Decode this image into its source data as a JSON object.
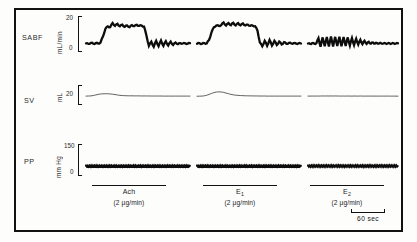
{
  "figure": {
    "rows": [
      {
        "key": "sabf",
        "label": "SABF",
        "unit": "mL/min",
        "tick_high": "20",
        "tick_low": "0"
      },
      {
        "key": "sv",
        "label": "SV",
        "unit": "mL",
        "tick_high": "20",
        "tick_low": ""
      },
      {
        "key": "pp",
        "label": "PP",
        "unit": "mm Hg",
        "tick_high": "150",
        "tick_low": "0"
      }
    ],
    "drugs": [
      {
        "name": "Ach",
        "sub": "",
        "dose": "(2 µg/min)"
      },
      {
        "name": "E",
        "sub": "1",
        "dose": "(2 µg/min)"
      },
      {
        "name": "E",
        "sub": "2",
        "dose": "(2 µg/min)"
      }
    ],
    "timescale": {
      "label": "60  sec"
    }
  },
  "chart_data": {
    "type": "line",
    "title": "",
    "xlabel": "",
    "ylabel": "",
    "grid": false,
    "legend": "none",
    "time_axis": {
      "unit": "sec",
      "scalebar_seconds": 60
    },
    "panels": [
      {
        "row": "SABF",
        "ylabel": "mL/min",
        "ylim": [
          0,
          20
        ],
        "yticks": [
          0,
          20
        ],
        "trials": [
          {
            "drug": "Ach",
            "dose": "2 µg/min",
            "description": "low oscillating baseline, sharp rise to sustained elevated plateau during infusion, then abrupt fall to baseline with large oscillations",
            "values": [
              4.5,
              4.2,
              4.8,
              4.3,
              4.6,
              4.4,
              5.0,
              8.5,
              13.0,
              14.5,
              14.0,
              16.5,
              14.8,
              16.0,
              14.5,
              15.5,
              14.2,
              15.0,
              14.0,
              15.2,
              14.6,
              15.4,
              14.8,
              15.0,
              14.4,
              9.0,
              3.0,
              5.5,
              2.5,
              6.0,
              2.8,
              6.2,
              3.0,
              5.8,
              3.2,
              5.5,
              3.5,
              5.0,
              4.0,
              4.6,
              4.4,
              4.5,
              4.3,
              4.6
            ]
          },
          {
            "drug": "E1",
            "dose": "2 µg/min",
            "description": "low baseline, rise to broad flat-topped plateau with fine ripples, fall to baseline with oscillations",
            "values": [
              4.3,
              4.6,
              4.2,
              4.7,
              4.4,
              6.5,
              11.0,
              14.0,
              15.0,
              14.8,
              15.2,
              16.8,
              15.0,
              16.5,
              15.2,
              16.6,
              15.0,
              16.4,
              15.1,
              16.2,
              15.0,
              15.5,
              14.8,
              15.0,
              14.6,
              12.0,
              5.0,
              2.8,
              6.0,
              3.0,
              6.5,
              3.2,
              6.0,
              3.5,
              5.6,
              3.8,
              5.2,
              4.2,
              4.8,
              4.4,
              4.6,
              4.3,
              4.5,
              4.4
            ]
          },
          {
            "drug": "E2",
            "dose": "2 µg/min",
            "description": "baseline with a burst of rapid large-amplitude oscillations during infusion, no sustained plateau",
            "values": [
              4.4,
              4.2,
              4.6,
              4.3,
              4.5,
              7.5,
              2.5,
              8.0,
              2.8,
              8.2,
              2.6,
              8.5,
              2.7,
              8.3,
              2.9,
              8.4,
              2.8,
              8.2,
              3.0,
              8.0,
              3.2,
              7.6,
              3.4,
              7.2,
              3.8,
              6.6,
              4.0,
              6.0,
              4.2,
              5.4,
              4.3,
              5.0,
              4.4,
              4.7,
              4.4,
              4.6,
              4.4,
              4.5,
              4.4,
              4.5,
              4.4,
              4.5,
              4.4,
              4.5
            ]
          }
        ]
      },
      {
        "row": "SV",
        "ylabel": "mL",
        "ylim": [
          0,
          20
        ],
        "yticks": [
          20
        ],
        "trials": [
          {
            "drug": "Ach",
            "dose": "2 µg/min",
            "description": "thin smooth trace with a small broad hump during infusion, returning to a flat slightly lower level",
            "values": [
              7.0,
              7.1,
              7.3,
              7.8,
              8.6,
              9.4,
              10.0,
              10.3,
              10.4,
              10.3,
              10.1,
              9.7,
              9.2,
              8.6,
              8.1,
              7.8,
              7.6,
              7.5,
              7.4,
              7.4,
              7.3,
              7.3,
              7.3,
              7.2,
              7.2,
              7.2,
              7.2,
              7.1,
              7.1,
              7.1,
              7.1,
              7.1,
              7.0,
              7.0,
              7.0,
              7.0,
              7.0,
              7.0,
              7.0,
              7.0,
              7.0,
              7.0,
              7.0,
              7.0
            ]
          },
          {
            "drug": "E1",
            "dose": "2 µg/min",
            "description": "thin smooth trace with a pronounced rounded peak during infusion then gradual decline",
            "values": [
              6.8,
              6.9,
              7.0,
              7.4,
              8.2,
              9.4,
              10.8,
              12.0,
              12.8,
              13.1,
              12.9,
              12.3,
              11.4,
              10.4,
              9.5,
              8.8,
              8.3,
              8.0,
              7.8,
              7.6,
              7.5,
              7.4,
              7.3,
              7.3,
              7.2,
              7.2,
              7.1,
              7.1,
              7.1,
              7.0,
              7.0,
              7.0,
              7.0,
              7.0,
              7.0,
              7.0,
              7.0,
              7.0,
              7.0,
              7.0,
              7.0,
              7.0,
              7.0,
              7.0
            ]
          },
          {
            "drug": "E2",
            "dose": "2 µg/min",
            "description": "essentially flat thin trace with negligible change during infusion",
            "values": [
              7.0,
              7.0,
              7.1,
              7.0,
              7.1,
              7.0,
              7.1,
              7.2,
              7.1,
              7.2,
              7.1,
              7.2,
              7.1,
              7.2,
              7.1,
              7.1,
              7.0,
              7.1,
              7.0,
              7.1,
              7.0,
              7.0,
              7.1,
              7.0,
              7.0,
              7.1,
              7.0,
              7.0,
              7.0,
              7.0,
              7.0,
              7.0,
              7.0,
              7.0,
              7.0,
              7.0,
              7.0,
              7.0,
              7.0,
              7.0,
              6.9,
              7.0,
              6.9,
              6.9
            ]
          }
        ]
      },
      {
        "row": "PP",
        "ylabel": "mm Hg",
        "ylim": [
          0,
          150
        ],
        "yticks": [
          0,
          150
        ],
        "trials": [
          {
            "drug": "Ach",
            "dose": "2 µg/min",
            "description": "dense dark band of pulse pressure oscillations at a steady mean level, essentially unchanged during infusion",
            "mean": 40,
            "band_amplitude": 7
          },
          {
            "drug": "E1",
            "dose": "2 µg/min",
            "description": "dense dark band of pulse pressure oscillations at a steady mean level, essentially unchanged during infusion",
            "mean": 40,
            "band_amplitude": 7
          },
          {
            "drug": "E2",
            "dose": "2 µg/min",
            "description": "dense dark band of pulse pressure oscillations at a steady mean level, essentially unchanged during infusion",
            "mean": 40,
            "band_amplitude": 8
          }
        ]
      }
    ]
  }
}
